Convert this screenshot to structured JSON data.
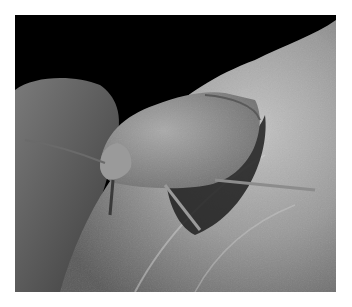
{
  "image": {
    "subject": "shield bug on leaf",
    "style": "grayscale macro photograph",
    "colors": {
      "background": "#000000",
      "frame": "#ffffff",
      "leaf_light": "#b8b8b8",
      "leaf_mid": "#8a8a8a",
      "leaf_dark": "#4a4a4a",
      "bug_body": "#8c8c8c",
      "bug_highlight": "#a8a8a8",
      "shadow": "#1e1e1e"
    }
  }
}
